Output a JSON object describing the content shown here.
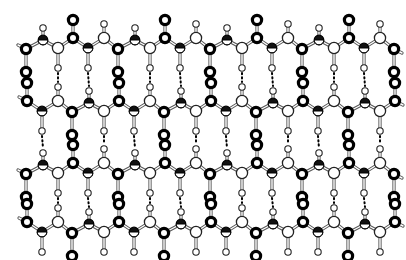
{
  "diagram": {
    "title": "",
    "type": "beta-sheet ball-and-stick model",
    "width": 406,
    "height": 260,
    "colors": {
      "background": "#ffffff",
      "oxygen": "#000000",
      "nitrogen": "#111111",
      "carbon": "#ffffff",
      "hydrogen": "#ffffff",
      "bond": "#555555"
    },
    "repeat_period_px": 92,
    "chains": [
      {
        "name": "strand-1",
        "y": 40,
        "phase": 0,
        "flip": false
      },
      {
        "name": "strand-2",
        "y": 103,
        "phase": 46,
        "flip": true
      },
      {
        "name": "strand-3",
        "y": 165,
        "phase": 0,
        "flip": false
      },
      {
        "name": "strand-4",
        "y": 224,
        "phase": 46,
        "flip": true
      }
    ],
    "unit": [
      {
        "el": "O",
        "dx": 0,
        "dy": 9,
        "sub": {
          "el": "O",
          "dy": 23
        }
      },
      {
        "el": "N",
        "dx": 17,
        "dy": 0,
        "sub": {
          "el": "H",
          "dy": -12
        }
      },
      {
        "el": "Ca",
        "dx": 32,
        "dy": 8,
        "sub": {
          "el": "H",
          "dy": 20
        }
      },
      {
        "el": "O",
        "dx": 47,
        "dy": -2,
        "sub": {
          "el": "O",
          "dy": -18
        }
      },
      {
        "el": "N",
        "dx": 62,
        "dy": 8,
        "sub": {
          "el": "H",
          "dy": 20
        }
      },
      {
        "el": "Ca",
        "dx": 78,
        "dy": -2,
        "sub": {
          "el": "H",
          "dy": -14
        }
      }
    ],
    "x_start": 26,
    "x_end": 395
  }
}
